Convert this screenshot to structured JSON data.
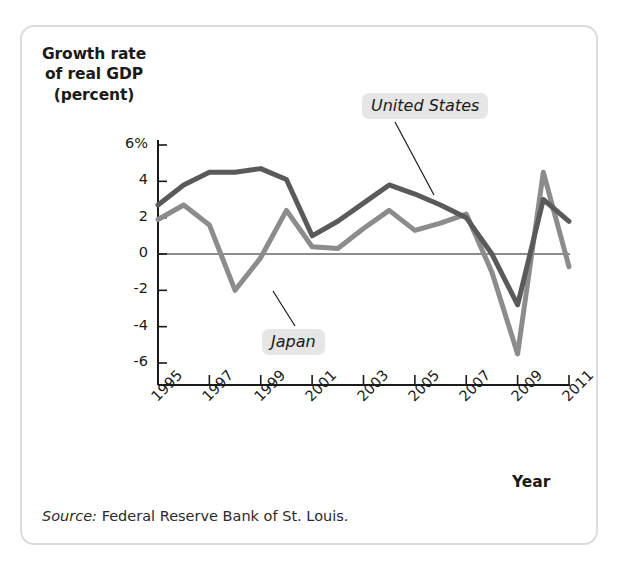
{
  "figure": {
    "source_prefix": "Source:",
    "source_text": "Federal Reserve Bank of St. Louis.",
    "frame_color": "#dcdcdc",
    "background": "#ffffff"
  },
  "labels": {
    "united_states": "United States",
    "japan": "Japan",
    "badge_background": "#e6e6e6"
  },
  "axis_title_lines": {
    "line1": "Growth rate",
    "line2": "of real GDP",
    "line3": "(percent)"
  },
  "chart_data": {
    "type": "line",
    "title": "Growth rate of real GDP (percent)",
    "xlabel": "Year",
    "ylabel": "Growth rate of real GDP (percent)",
    "grid": false,
    "legend_position": "inline-annotation",
    "xlim": [
      1995,
      2011
    ],
    "ylim": [
      -6,
      6
    ],
    "ytick_labels": [
      "6%",
      "4",
      "2",
      "0",
      "-2",
      "-4",
      "-6"
    ],
    "yticks": [
      6,
      4,
      2,
      0,
      -2,
      -4,
      -6
    ],
    "xtick_labels": [
      "1995",
      "1997",
      "1999",
      "2001",
      "2003",
      "2005",
      "2007",
      "2009",
      "2011"
    ],
    "xticks": [
      1995,
      1997,
      1999,
      2001,
      2003,
      2005,
      2007,
      2009,
      2011
    ],
    "x": [
      1995,
      1996,
      1997,
      1998,
      1999,
      2000,
      2001,
      2002,
      2003,
      2004,
      2005,
      2006,
      2007,
      2008,
      2009,
      2010,
      2011
    ],
    "series": [
      {
        "name": "United States",
        "color": "#5a5a5a",
        "values": [
          2.7,
          3.8,
          4.5,
          4.5,
          4.7,
          4.1,
          1.0,
          1.8,
          2.8,
          3.8,
          3.3,
          2.7,
          2.0,
          0.0,
          -2.8,
          3.0,
          1.8
        ]
      },
      {
        "name": "Japan",
        "color": "#8c8c8c",
        "values": [
          1.9,
          2.7,
          1.6,
          -2.0,
          -0.2,
          2.4,
          0.4,
          0.3,
          1.4,
          2.4,
          1.3,
          1.7,
          2.2,
          -1.0,
          -5.5,
          4.5,
          -0.7
        ]
      }
    ],
    "zero_line": 0
  }
}
